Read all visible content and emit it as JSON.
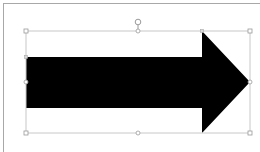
{
  "canvas": {
    "background": "#ffffff",
    "page_border_color": "#a8a8a8"
  },
  "shape": {
    "type": "right-arrow",
    "fill": "#000000",
    "selected": true,
    "bounds": {
      "x": 26,
      "y": 31,
      "width": 224,
      "height": 102
    },
    "shaft": {
      "top": 57,
      "bottom": 108
    },
    "head_start_x": 202,
    "tip": {
      "x": 250,
      "y": 82
    }
  },
  "selection": {
    "outline_color": "#c8c8c8",
    "handle_color": "#ffffff",
    "handle_stroke": "#9a9a9a",
    "rotation_handle": {
      "x": 138,
      "y": 22
    }
  }
}
